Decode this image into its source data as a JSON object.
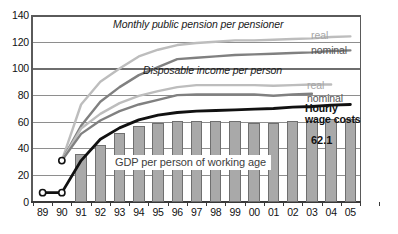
{
  "chart_data": {
    "type": "bar",
    "title": "",
    "xlabel": "",
    "ylabel": "",
    "ylim": [
      0,
      140
    ],
    "yticks": [
      0,
      20,
      40,
      60,
      80,
      100,
      120,
      140
    ],
    "grid": true,
    "legend_position": "inline-right",
    "categories": [
      "89",
      "90",
      "91",
      "92",
      "93",
      "94",
      "95",
      "96",
      "97",
      "98",
      "99",
      "00",
      "01",
      "02",
      "03",
      "04",
      "05"
    ],
    "series": [
      {
        "name": "GDP per person of working age",
        "type": "bar",
        "color": "#a9a9a9",
        "values": [
          null,
          null,
          36,
          43,
          51.5,
          57,
          59.5,
          61,
          61,
          60.5,
          60.5,
          59.5,
          59.5,
          60.5,
          61,
          62,
          62.1
        ]
      },
      {
        "name": "Monthly public pension per pensioner — real",
        "type": "line",
        "color": "#bdbdbd",
        "values": [
          null,
          31,
          73,
          90,
          100,
          109,
          114,
          117.5,
          119,
          120,
          121,
          121,
          121.5,
          122,
          122.5,
          123.5,
          124
        ]
      },
      {
        "name": "Monthly public pension per pensioner — nominal",
        "type": "line",
        "color": "#808080",
        "values": [
          null,
          31,
          57,
          75,
          86,
          95,
          101,
          107,
          108,
          109,
          110,
          110.5,
          111,
          111.5,
          112,
          113,
          113.5
        ]
      },
      {
        "name": "Disposable income per person — real",
        "type": "line",
        "color": "#bdbdbd",
        "values": [
          null,
          31,
          55,
          66,
          74,
          79.5,
          83,
          86,
          87.5,
          87.5,
          87.5,
          87.5,
          87,
          87.5,
          88,
          88,
          null
        ]
      },
      {
        "name": "Disposable income per person — nominal",
        "type": "line",
        "color": "#808080",
        "values": [
          null,
          31,
          51,
          61,
          68,
          73,
          76.5,
          80,
          80.5,
          80.5,
          80.5,
          80.5,
          79.5,
          80.5,
          81,
          null,
          null
        ]
      },
      {
        "name": "Hourly wage costs",
        "type": "line",
        "color": "#111111",
        "values": [
          7,
          7,
          31,
          47,
          55.5,
          61.5,
          65,
          67,
          68,
          68.5,
          69,
          69.5,
          70,
          71,
          71.5,
          72.5,
          73
        ]
      }
    ],
    "annotations": [
      {
        "id": "pension-title",
        "text": "Monthly public pension per pensioner"
      },
      {
        "id": "income-title",
        "text": "Disposable income per person"
      },
      {
        "id": "gdp-title",
        "text": "GDP per person of working age"
      },
      {
        "id": "pension-real",
        "text": "real"
      },
      {
        "id": "pension-nominal",
        "text": "nominal"
      },
      {
        "id": "income-real",
        "text": "real"
      },
      {
        "id": "income-nominal",
        "text": "nominal"
      },
      {
        "id": "wage-label-1",
        "text": "Hourly"
      },
      {
        "id": "wage-label-2",
        "text": "wage costs"
      },
      {
        "id": "gdp-value",
        "text": "62.1"
      }
    ]
  },
  "axis": {
    "y_labels": [
      "140",
      "120",
      "100",
      "80",
      "60",
      "40",
      "20",
      "0"
    ],
    "x_labels": [
      "89",
      "90",
      "91",
      "92",
      "93",
      "94",
      "95",
      "96",
      "97",
      "98",
      "99",
      "00",
      "01",
      "02",
      "03",
      "04",
      "05"
    ]
  },
  "labels": {
    "pension_title": "Monthly public pension per pensioner",
    "income_title": "Disposable income per person",
    "gdp_title": "GDP per person of working age",
    "pension_real": "real",
    "pension_nominal": "nominal",
    "income_real": "real",
    "income_nominal": "nominal",
    "wage_line1": "Hourly",
    "wage_line2": "wage costs",
    "gdp_value": "62.1"
  },
  "colors": {
    "bar_fill": "#a9a9a9",
    "bar_stroke": "#6f6f6f",
    "line_light": "#bdbdbd",
    "line_mid": "#808080",
    "line_dark": "#111111",
    "grid": "#8e8e8e",
    "frame": "#5a5a5a",
    "background": "#ffffff"
  }
}
